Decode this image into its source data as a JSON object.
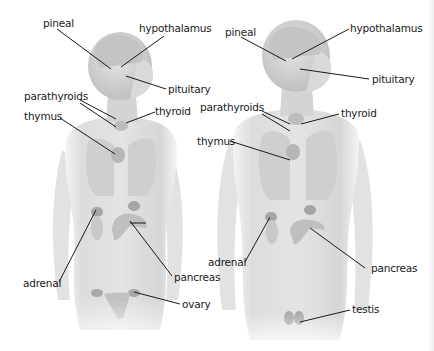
{
  "diagram": {
    "title": "",
    "figures": [
      {
        "id": "female",
        "labels": {
          "pineal": "pineal",
          "hypothalamus": "hypothalamus",
          "pituitary": "pituitary",
          "parathyroids": "parathyroids",
          "thyroid": "thyroid",
          "thymus": "thymus",
          "adrenal": "adrenal",
          "pancreas": "pancreas",
          "gonad": "ovary"
        }
      },
      {
        "id": "male",
        "labels": {
          "pineal": "pineal",
          "hypothalamus": "hypothalamus",
          "pituitary": "pituitary",
          "parathyroids": "parathyroids",
          "thyroid": "thyroid",
          "thymus": "thymus",
          "adrenal": "adrenal",
          "pancreas": "pancreas",
          "gonad": "testis"
        }
      }
    ],
    "colors": {
      "skin": "#d9d9d9",
      "skin_light": "#ececec",
      "organ": "#b8b8b8",
      "gland": "#9a9a9a",
      "leader_line": "#1a1a1a",
      "text": "#1a1a1a"
    }
  }
}
